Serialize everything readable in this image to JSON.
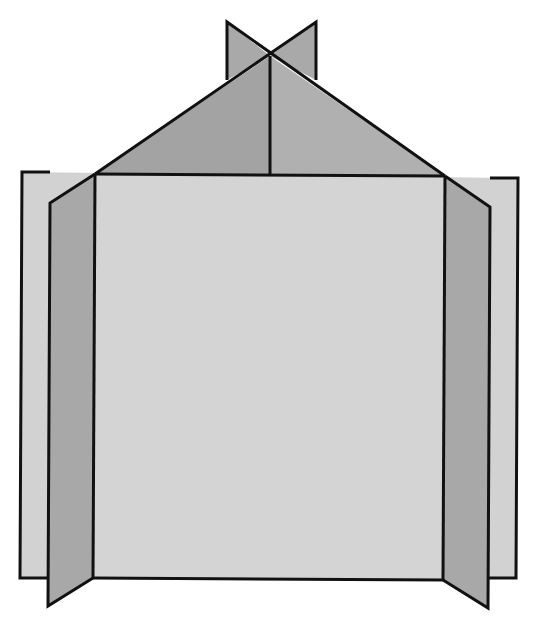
{
  "diagram": {
    "colors": {
      "back_plane": "#d2d2d2",
      "front_plane": "#d4d4d4",
      "side_panel": "#a8a8a8",
      "roof_left": "#a3a3a3",
      "roof_right": "#b0b0b0",
      "top_fin": "#a9a9a9",
      "edge": "#111111",
      "background": "#ffffff"
    },
    "labels": []
  }
}
